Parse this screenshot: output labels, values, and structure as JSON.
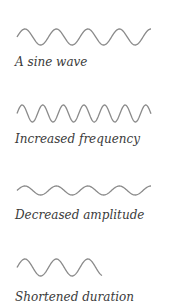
{
  "figure": {
    "stroke_color": "#8a8a8a",
    "text_color": "#3a3a3a",
    "panels": [
      {
        "id": "sine",
        "caption": "A sine wave",
        "x0": 17,
        "x1": 151,
        "mid_y": 37,
        "amplitude": 8,
        "period": 31.5,
        "phase": 0
      },
      {
        "id": "freq",
        "caption": "Increased frequency",
        "x0": 17,
        "x1": 151,
        "mid_y": 113.5,
        "amplitude": 8.5,
        "period": 20.6,
        "phase": 0
      },
      {
        "id": "amp",
        "caption": "Decreased amplitude",
        "x0": 17,
        "x1": 151,
        "mid_y": 190.5,
        "amplitude": 4.5,
        "period": 31.5,
        "phase": 0
      },
      {
        "id": "dur",
        "caption": "Shortened duration",
        "x0": 17,
        "x1": 102,
        "mid_y": 267.5,
        "amplitude": 8.5,
        "period": 31.5,
        "phase": 0
      }
    ]
  }
}
